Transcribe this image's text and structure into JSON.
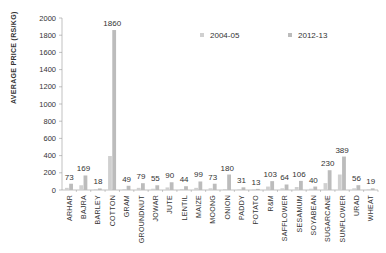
{
  "chart_data": {
    "type": "bar",
    "title": "",
    "xlabel": "",
    "ylabel": "AVERAGE PRICE (RS/KG)",
    "ylim": [
      0,
      2000
    ],
    "yticks": [
      0,
      200,
      400,
      600,
      800,
      1000,
      1200,
      1400,
      1600,
      1800,
      2000
    ],
    "grid": false,
    "legend_position": "top-right",
    "categories": [
      "ARHAR",
      "BAJRA",
      "BARLEY",
      "COTTON",
      "GRAM",
      "GROUNDNUT",
      "JOWAR",
      "JUTE",
      "LENTIL",
      "MAIZE",
      "MOONG",
      "ONION",
      "PADDY",
      "POTATO",
      "R&M",
      "SAFFLOWER",
      "SESAMUM",
      "SOYABEAN",
      "SUGARCANE",
      "SUNFLOWER",
      "URAD",
      "WHEAT"
    ],
    "series": [
      {
        "name": "2004-05",
        "color": "#d0d0d0",
        "values": [
          25,
          55,
          8,
          395,
          10,
          25,
          15,
          30,
          12,
          25,
          20,
          10,
          8,
          5,
          40,
          20,
          35,
          15,
          80,
          180,
          20,
          8
        ]
      },
      {
        "name": "2012-13",
        "color": "#bcbcbc",
        "values": [
          73,
          169,
          18,
          1860,
          49,
          79,
          55,
          90,
          44,
          99,
          73,
          180,
          31,
          13,
          103,
          64,
          106,
          40,
          230,
          389,
          56,
          19
        ]
      }
    ],
    "data_labels": [
      73,
      169,
      18,
      1860,
      49,
      79,
      55,
      90,
      44,
      99,
      73,
      180,
      31,
      13,
      103,
      64,
      106,
      40,
      230,
      389,
      56,
      19
    ]
  },
  "legend": {
    "items": [
      {
        "label": "2004-05",
        "color": "#d0d0d0"
      },
      {
        "label": "2012-13",
        "color": "#bcbcbc"
      }
    ]
  },
  "axis": {
    "ylabel": "AVERAGE PRICE (RS/KG)"
  }
}
